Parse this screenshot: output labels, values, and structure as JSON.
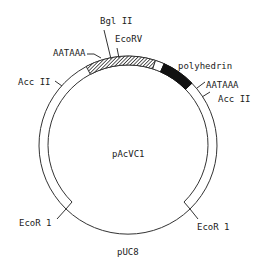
{
  "diagram": {
    "type": "plasmid-map",
    "name": "pAcVC1",
    "backbone_label": "pUC8",
    "colors": {
      "line": "#333333",
      "hatched": "#444444",
      "solid": "#111111",
      "background": "#ffffff"
    },
    "regions": [
      {
        "name": "insert-hatched",
        "style": "hatched"
      },
      {
        "name": "insert-gap",
        "style": "white"
      },
      {
        "name": "polyhedrin",
        "style": "solid"
      }
    ],
    "labels": {
      "bgl2": "Bgl II",
      "ecorv": "EcoRV",
      "aataaa_left": "AATAAA",
      "polyhedrin": "polyhedrin",
      "aataaa_right": "AATAAA",
      "acc2_left": "Acc II",
      "acc2_right": "Acc II",
      "ecor1_left": "EcoR 1",
      "ecor1_right": "EcoR 1",
      "center": "pAcVC1",
      "bottom": "pUC8"
    }
  }
}
